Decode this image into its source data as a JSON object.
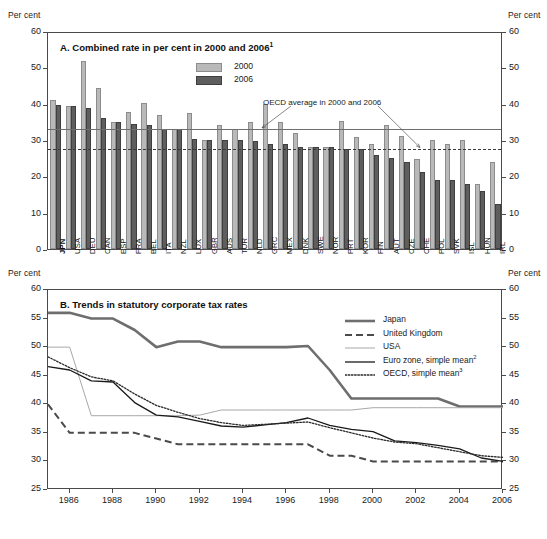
{
  "axis_unit_label": "Per cent",
  "panelA": {
    "title": "A. Combined rate in per cent in 2000 and 2006",
    "title_footnote": "1",
    "legend": [
      {
        "label": "2000",
        "color": "#b9b9b9"
      },
      {
        "label": "2006",
        "color": "#5e5e5e"
      }
    ],
    "annotation": "OECD average in 2000 and 2006",
    "oecd_average_2000": 33.6,
    "oecd_average_2006": 28.2
  },
  "panelB": {
    "title": "B. Trends in statutory corporate tax rates",
    "legend": [
      {
        "label": "Japan",
        "style": "thick-gray",
        "color": "#6e6e6e"
      },
      {
        "label": "United Kingdom",
        "style": "dashed",
        "color": "#4a4a4a"
      },
      {
        "label": "USA",
        "style": "thin-gray",
        "color": "#a8a8a8"
      },
      {
        "label": "Euro zone, simple mean",
        "footnote": "2",
        "style": "solid-black",
        "color": "#1a1a1a"
      },
      {
        "label": "OECD, simple mean",
        "footnote": "3",
        "style": "dotted",
        "color": "#2a2a2a"
      }
    ]
  },
  "chart_data": [
    {
      "type": "bar",
      "panel": "A",
      "title": "A. Combined rate in per cent in 2000 and 2006",
      "xlabel": "",
      "ylabel": "Per cent",
      "ylim": [
        0,
        60
      ],
      "yticks": [
        0,
        10,
        20,
        30,
        40,
        50,
        60
      ],
      "grid": false,
      "legend_position": "top-center",
      "categories": [
        "JPN",
        "USA",
        "DEU",
        "CAN",
        "ESP",
        "FRA",
        "BEL",
        "ITA",
        "NZL",
        "LUX",
        "GBR",
        "AUS",
        "TUR",
        "NLD",
        "GRC",
        "MEX",
        "DNK",
        "SWE",
        "NOR",
        "PRT",
        "KOR",
        "FIN",
        "AUT",
        "CZE",
        "CHE",
        "POL",
        "SVK",
        "ISL",
        "HUN",
        "IRL"
      ],
      "series": [
        {
          "name": "2000",
          "color": "#b9b9b9",
          "values": [
            40.9,
            39.3,
            51.8,
            44.4,
            35.0,
            37.8,
            40.2,
            37.0,
            33.0,
            37.5,
            30.0,
            34.0,
            33.0,
            35.0,
            40.0,
            35.0,
            32.0,
            28.0,
            28.0,
            35.2,
            30.9,
            29.0,
            34.0,
            31.0,
            24.9,
            30.0,
            29.0,
            30.0,
            18.0,
            24.0
          ]
        },
        {
          "name": "2006",
          "color": "#5e5e5e",
          "values": [
            39.5,
            39.3,
            38.9,
            36.1,
            35.0,
            34.4,
            34.0,
            33.0,
            33.0,
            30.4,
            30.0,
            30.0,
            30.0,
            29.6,
            29.0,
            29.0,
            28.0,
            28.0,
            28.0,
            27.5,
            27.5,
            26.0,
            25.0,
            24.0,
            21.3,
            19.0,
            19.0,
            18.0,
            16.0,
            12.5
          ]
        }
      ],
      "reference_lines": [
        {
          "label": "OECD average in 2000",
          "value": 33.6,
          "style": "solid"
        },
        {
          "label": "OECD average in 2006",
          "value": 28.2,
          "style": "dashed"
        }
      ],
      "annotations": [
        {
          "text": "OECD average in 2000 and 2006",
          "points_to": [
            33.6,
            28.2
          ]
        }
      ]
    },
    {
      "type": "line",
      "panel": "B",
      "title": "B. Trends in statutory corporate tax rates",
      "xlabel": "",
      "ylabel": "Per cent",
      "ylim": [
        25,
        60
      ],
      "yticks": [
        25,
        30,
        35,
        40,
        45,
        50,
        55,
        60
      ],
      "xlim": [
        1985,
        2006
      ],
      "xticks": [
        1986,
        1988,
        1990,
        1992,
        1994,
        1996,
        1998,
        2000,
        2002,
        2004,
        2006
      ],
      "grid": false,
      "legend_position": "top-right",
      "x": [
        1985,
        1986,
        1987,
        1988,
        1989,
        1990,
        1991,
        1992,
        1993,
        1994,
        1995,
        1996,
        1997,
        1998,
        1999,
        2000,
        2001,
        2002,
        2003,
        2004,
        2005,
        2006
      ],
      "series": [
        {
          "name": "Japan",
          "style": "thick-gray",
          "color": "#6e6e6e",
          "values": [
            56.0,
            56.0,
            55.0,
            55.0,
            53.0,
            50.0,
            51.0,
            51.0,
            50.0,
            50.0,
            50.0,
            50.0,
            50.2,
            46.0,
            41.0,
            41.0,
            41.0,
            41.0,
            41.0,
            39.6,
            39.6,
            39.6
          ]
        },
        {
          "name": "United Kingdom",
          "style": "dashed",
          "color": "#4a4a4a",
          "values": [
            40.0,
            35.0,
            35.0,
            35.0,
            35.0,
            34.0,
            33.0,
            33.0,
            33.0,
            33.0,
            33.0,
            33.0,
            33.0,
            31.0,
            31.0,
            30.0,
            30.0,
            30.0,
            30.0,
            30.0,
            30.0,
            30.0
          ]
        },
        {
          "name": "USA",
          "style": "thin-gray",
          "color": "#a8a8a8",
          "values": [
            50.0,
            50.0,
            38.0,
            38.0,
            38.0,
            38.0,
            38.0,
            38.1,
            39.0,
            39.0,
            39.0,
            39.0,
            39.0,
            39.0,
            39.0,
            39.4,
            39.4,
            39.4,
            39.4,
            39.4,
            39.4,
            39.4
          ]
        },
        {
          "name": "Euro zone, simple mean",
          "footnote": "2",
          "style": "solid-black",
          "color": "#1a1a1a",
          "values": [
            46.6,
            46.0,
            44.1,
            43.9,
            40.3,
            38.1,
            37.8,
            37.0,
            36.2,
            36.0,
            36.4,
            36.8,
            37.6,
            36.3,
            35.6,
            35.2,
            33.6,
            33.3,
            32.8,
            32.2,
            30.6,
            30.0
          ]
        },
        {
          "name": "OECD, simple mean",
          "footnote": "3",
          "style": "dotted",
          "color": "#2a2a2a",
          "values": [
            48.3,
            46.4,
            44.8,
            44.1,
            41.8,
            39.8,
            38.6,
            37.5,
            36.8,
            36.3,
            36.5,
            36.7,
            36.9,
            35.9,
            35.0,
            34.1,
            33.4,
            33.1,
            32.4,
            31.7,
            31.0,
            30.7
          ]
        }
      ]
    }
  ]
}
